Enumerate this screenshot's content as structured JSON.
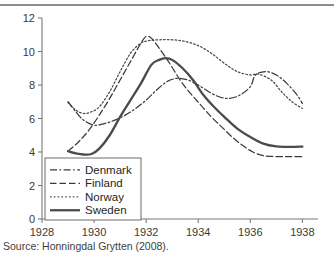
{
  "figure": {
    "top_rule_color": "#8d8d8d",
    "background": "#ffffff",
    "title_fragment": ""
  },
  "source_note": "Source: Honningdal Grytten (2008).",
  "chart_data": {
    "type": "line",
    "title": "",
    "subtitle": "",
    "xlabel": "",
    "ylabel": "",
    "xlim": [
      1928,
      1938.6
    ],
    "ylim": [
      0,
      12
    ],
    "xticks": [
      1928,
      1930,
      1932,
      1934,
      1936,
      1938
    ],
    "xtick_labels": [
      "1928",
      "1930",
      "1932",
      "1934",
      "1936",
      "1938"
    ],
    "yticks": [
      0,
      2,
      4,
      6,
      8,
      10,
      12
    ],
    "ytick_labels": [
      "0",
      "2",
      "4",
      "6",
      "8",
      "10",
      "12"
    ],
    "grid": false,
    "legend_position": "lower-left",
    "legend_entries": [
      "Denmark",
      "Finland",
      "Norway",
      "Sweden"
    ],
    "series": [
      {
        "name": "Denmark",
        "style": "dash-dot",
        "color": "#3a3a3a",
        "width": 1.25,
        "dasharray": "7,2.5,1.6,2.5",
        "x": [
          1929.0,
          1929.3,
          1929.6,
          1930.0,
          1930.4,
          1930.8,
          1931.2,
          1931.6,
          1932.0,
          1932.4,
          1932.8,
          1933.2,
          1933.6,
          1934.0,
          1934.4,
          1934.8,
          1935.2,
          1935.6,
          1936.0,
          1936.2,
          1936.6,
          1937.0,
          1937.4,
          1937.8,
          1938.0
        ],
        "y": [
          7.0,
          6.4,
          5.9,
          5.6,
          5.7,
          5.9,
          6.2,
          6.6,
          7.1,
          7.7,
          8.2,
          8.4,
          8.3,
          8.0,
          7.6,
          7.3,
          7.2,
          7.4,
          7.9,
          8.6,
          8.8,
          8.6,
          8.1,
          7.4,
          6.9
        ]
      },
      {
        "name": "Finland",
        "style": "dashed",
        "color": "#3a3a3a",
        "width": 1.25,
        "dasharray": "6.5,3",
        "x": [
          1929.0,
          1929.4,
          1929.8,
          1930.2,
          1930.6,
          1931.0,
          1931.4,
          1931.8,
          1932.0,
          1932.2,
          1932.5,
          1932.9,
          1933.3,
          1933.7,
          1934.1,
          1934.5,
          1934.9,
          1935.3,
          1935.7,
          1936.1,
          1936.5,
          1937.0,
          1937.5,
          1938.0
        ],
        "y": [
          4.05,
          4.6,
          5.3,
          6.2,
          7.2,
          8.3,
          9.4,
          10.5,
          10.9,
          10.8,
          10.2,
          9.3,
          8.3,
          7.5,
          6.8,
          6.1,
          5.5,
          4.9,
          4.4,
          4.0,
          3.78,
          3.73,
          3.73,
          3.73
        ]
      },
      {
        "name": "Norway",
        "style": "dotted",
        "color": "#4a4a4a",
        "width": 1.25,
        "dasharray": "1.6,2.2",
        "x": [
          1929.0,
          1929.3,
          1929.6,
          1929.9,
          1930.2,
          1930.6,
          1931.0,
          1931.4,
          1931.8,
          1932.1,
          1932.5,
          1933.0,
          1933.5,
          1934.0,
          1934.5,
          1935.0,
          1935.5,
          1936.0,
          1936.3,
          1936.8,
          1937.2,
          1937.6,
          1938.0
        ],
        "y": [
          6.95,
          6.5,
          6.3,
          6.4,
          6.7,
          7.6,
          8.8,
          9.9,
          10.5,
          10.65,
          10.7,
          10.7,
          10.6,
          10.35,
          9.9,
          9.3,
          8.8,
          8.6,
          8.65,
          8.3,
          7.6,
          7.0,
          6.6
        ]
      },
      {
        "name": "Sweden",
        "style": "solid",
        "color": "#4b4b4b",
        "width": 2.3,
        "dasharray": "",
        "x": [
          1929.0,
          1929.3,
          1929.6,
          1929.9,
          1930.2,
          1930.6,
          1931.0,
          1931.4,
          1931.8,
          1932.2,
          1932.5,
          1932.75,
          1933.0,
          1933.4,
          1933.8,
          1934.2,
          1934.6,
          1935.0,
          1935.5,
          1936.0,
          1936.5,
          1937.0,
          1937.5,
          1938.0
        ],
        "y": [
          4.05,
          3.92,
          3.85,
          3.88,
          4.2,
          5.0,
          6.1,
          7.1,
          8.1,
          9.2,
          9.5,
          9.6,
          9.5,
          9.0,
          8.3,
          7.4,
          6.7,
          6.1,
          5.4,
          4.9,
          4.5,
          4.33,
          4.3,
          4.32
        ]
      }
    ]
  }
}
